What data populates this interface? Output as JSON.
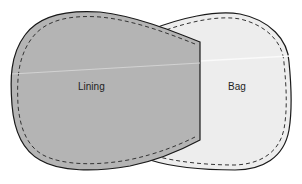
{
  "diagram": {
    "labels": {
      "lining": "Lining",
      "bag": "Bag"
    },
    "colors": {
      "lining_fill": "#b4b4b4",
      "bag_fill": "#ededed",
      "outline": "#1a1a1a",
      "stitch": "#333333",
      "background": "#ffffff"
    }
  }
}
